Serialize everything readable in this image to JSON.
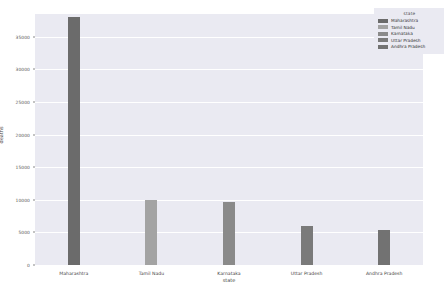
{
  "chart_data": {
    "type": "bar",
    "title": "",
    "subtitle": "",
    "xlabel": "state",
    "ylabel": "deaths",
    "categories": [
      "Maharashtra",
      "Tamil Nadu",
      "Karnataka",
      "Uttar Pradesh",
      "Andhra Pradesh"
    ],
    "values": [
      38000,
      10000,
      9700,
      6000,
      5400
    ],
    "ylim": [
      0,
      38500
    ],
    "yticks": [
      0,
      5000,
      10000,
      15000,
      20000,
      25000,
      30000,
      35000
    ],
    "ytick_labels": [
      "0",
      "5000",
      "10000",
      "15000",
      "20000",
      "25000",
      "30000",
      "35000"
    ],
    "grid": true,
    "legend_position": "upper right",
    "legend_title": "state",
    "legend_entries": [
      {
        "label": "Maharashtra",
        "color": "#6b6b6b"
      },
      {
        "label": "Tamil Nadu",
        "color": "#a3a3a3"
      },
      {
        "label": "Karnataka",
        "color": "#8a8a8a"
      },
      {
        "label": "Uttar Pradesh",
        "color": "#7a7a7a"
      },
      {
        "label": "Andhra Pradesh",
        "color": "#727272"
      }
    ],
    "bar_colors": [
      "#6b6b6b",
      "#a3a3a3",
      "#8a8a8a",
      "#7a7a7a",
      "#727272"
    ],
    "plot_background": "#eaeaf2",
    "grid_color": "#ffffff",
    "figure_background": "#ffffff"
  }
}
